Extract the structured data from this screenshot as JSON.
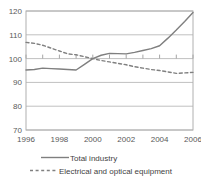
{
  "chart_data": {
    "type": "line",
    "title": "",
    "subtitle": "",
    "xlabel": "",
    "ylabel": "",
    "xlim": [
      1996,
      2006
    ],
    "ylim": [
      70,
      120
    ],
    "yticks": [
      70,
      80,
      90,
      100,
      110,
      120
    ],
    "xticks": [
      1996,
      1998,
      2000,
      2002,
      2004,
      2006
    ],
    "ytick_labels": [
      "70",
      "80",
      "90",
      "100",
      "110",
      "120"
    ],
    "xtick_labels": [
      "1996",
      "1998",
      "2000",
      "2002",
      "2004",
      "2006"
    ],
    "grid": "horizontal",
    "legend_position": "bottom",
    "x": [
      1996,
      1996.5,
      1997,
      1997.5,
      1998,
      1998.5,
      1999,
      1999.5,
      2000,
      2000.5,
      2001,
      2001.5,
      2002,
      2002.5,
      2003,
      2003.5,
      2004,
      2004.5,
      2005,
      2005.5,
      2006
    ],
    "series": [
      {
        "name": "Total industry",
        "style": "solid",
        "color": "#7f7f7f",
        "values": [
          95.2,
          95.4,
          96.0,
          95.8,
          95.6,
          95.4,
          95.2,
          97.6,
          100.0,
          101.4,
          102.2,
          102.1,
          102.0,
          102.6,
          103.4,
          104.2,
          105.4,
          108.6,
          112.0,
          115.6,
          119.4
        ]
      },
      {
        "name": "Electrical and optical equipment",
        "style": "dashed",
        "color": "#808080",
        "values": [
          106.8,
          106.4,
          105.6,
          104.4,
          103.2,
          102.0,
          101.6,
          100.8,
          100.0,
          99.2,
          98.6,
          98.0,
          97.4,
          96.6,
          96.0,
          95.4,
          95.0,
          94.4,
          93.8,
          94.0,
          94.2
        ]
      }
    ]
  },
  "legend": {
    "items": [
      {
        "label": "Total industry",
        "style": "solid"
      },
      {
        "label": "Electrical and optical equipment",
        "style": "dashed"
      }
    ]
  },
  "colors": {
    "series_total_industry": "#7f7f7f",
    "series_electrical": "#808080",
    "gridline": "#c0c0c0",
    "axis": "#a6a6a6",
    "tick_label": "#595959"
  }
}
